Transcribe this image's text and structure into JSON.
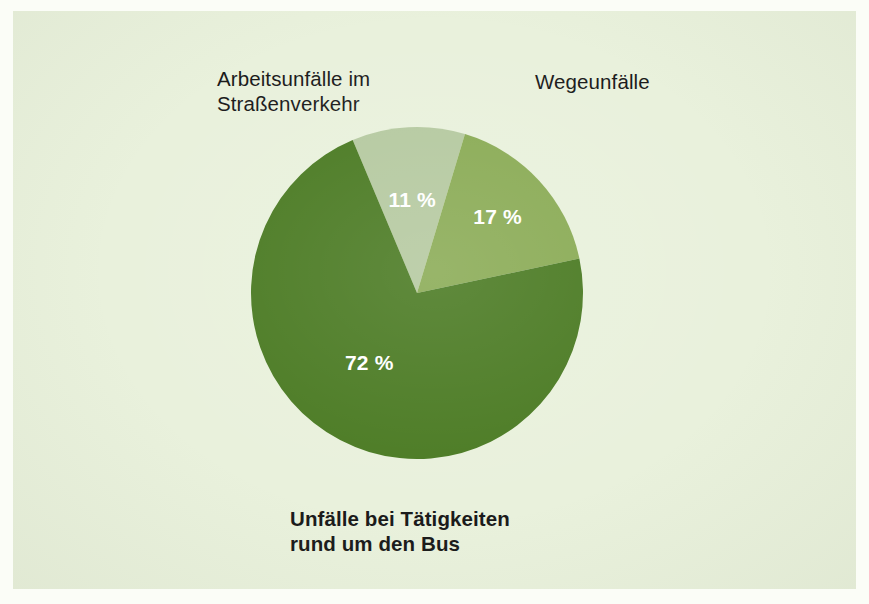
{
  "figure": {
    "background_color": "#e9f1dc",
    "page_color": "#fbfdf7"
  },
  "labels": {
    "top_left": "Arbeitsunfälle im\nStraßenverkehr",
    "top_right": "Wegeunfälle",
    "bottom": "Unfälle bei Tätigkeiten\nrund um den Bus"
  },
  "slice_labels": {
    "light": "11 %",
    "medium": "17 %",
    "dark": "72 %"
  },
  "chart_data": {
    "type": "pie",
    "title": "",
    "subtitle": "",
    "xlabel": "",
    "ylabel": "",
    "grid": false,
    "legend_position": "outside-callout-labels",
    "start_angle_deg": -22.8,
    "direction": "clockwise",
    "units": "percent",
    "categories": [
      "Arbeitsunfälle im Straßenverkehr",
      "Wegeunfälle",
      "Unfälle bei Tätigkeiten rund um den Bus"
    ],
    "values": [
      11,
      17,
      72
    ],
    "data_labels": [
      "11 %",
      "17 %",
      "72 %"
    ],
    "colors": [
      "#b5c9a0",
      "#8aab55",
      "#4a7a22"
    ],
    "slices": [
      {
        "name": "Arbeitsunfälle im Straßenverkehr",
        "value": 11,
        "label": "11 %",
        "color": "#b5c9a0",
        "start_angle_deg": -22.8,
        "end_angle_deg": 16.8
      },
      {
        "name": "Wegeunfälle",
        "value": 17,
        "label": "17 %",
        "color": "#8aab55",
        "start_angle_deg": 16.8,
        "end_angle_deg": 78.0
      },
      {
        "name": "Unfälle bei Tätigkeiten rund um den Bus",
        "value": 72,
        "label": "72 %",
        "color": "#4a7a22",
        "start_angle_deg": 78.0,
        "end_angle_deg": 337.2
      }
    ]
  }
}
